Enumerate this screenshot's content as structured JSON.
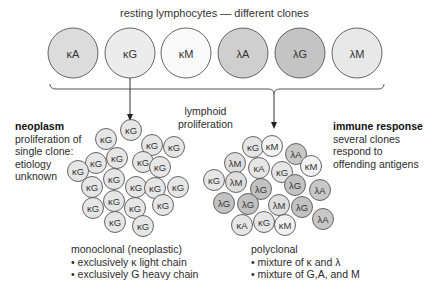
{
  "title": "resting lymphocytes — different clones",
  "resting_cells": [
    {
      "label": "κA",
      "fill": "#dcdcdc",
      "cx": 73,
      "cy": 53
    },
    {
      "label": "κG",
      "fill": "#ececec",
      "cx": 130,
      "cy": 53
    },
    {
      "label": "κM",
      "fill": "#fafafa",
      "cx": 186,
      "cy": 53
    },
    {
      "label": "λA",
      "fill": "#cfcfcf",
      "cx": 243,
      "cy": 53
    },
    {
      "label": "λG",
      "fill": "#c4c4c4",
      "cx": 300,
      "cy": 53
    },
    {
      "label": "λM",
      "fill": "#e8e8e8",
      "cx": 357,
      "cy": 53
    }
  ],
  "center_label": [
    "lymphoid",
    "proliferation"
  ],
  "left_panel": {
    "heading": "neoplasm",
    "lines": [
      "proliferation of",
      "single clone:",
      "etiology",
      "unknown"
    ],
    "caption_title": "monoclonal (neoplastic)",
    "bullets": [
      "exclusively κ light chain",
      "exclusively G heavy chain"
    ]
  },
  "right_panel": {
    "heading": "immune response",
    "lines": [
      "several clones",
      "respond to",
      "offending antigens"
    ],
    "caption_title": "polyclonal",
    "bullets": [
      "mixture of κ and λ",
      "mixture of G,A, and M"
    ]
  },
  "colors": {
    "outline": "#555555",
    "kappa_fill": "#e6e6e6",
    "lambda_fill": "#c8c8c8",
    "lambdaM_fill": "#dedede"
  },
  "monoclonal_cells": [
    {
      "label": "κG",
      "cx": 131,
      "cy": 130
    },
    {
      "label": "κG",
      "cx": 106,
      "cy": 139
    },
    {
      "label": "κG",
      "cx": 152,
      "cy": 145
    },
    {
      "label": "κG",
      "cx": 174,
      "cy": 147
    },
    {
      "label": "κG",
      "cx": 117,
      "cy": 158
    },
    {
      "label": "κG",
      "cx": 96,
      "cy": 163
    },
    {
      "label": "κG",
      "cx": 143,
      "cy": 162
    },
    {
      "label": "κG",
      "cx": 160,
      "cy": 167
    },
    {
      "label": "κG",
      "cx": 78,
      "cy": 171
    },
    {
      "label": "κG",
      "cx": 114,
      "cy": 179
    },
    {
      "label": "κG",
      "cx": 92,
      "cy": 187
    },
    {
      "label": "κG",
      "cx": 136,
      "cy": 187
    },
    {
      "label": "κG",
      "cx": 155,
      "cy": 188
    },
    {
      "label": "κG",
      "cx": 178,
      "cy": 187
    },
    {
      "label": "κG",
      "cx": 114,
      "cy": 201
    },
    {
      "label": "κG",
      "cx": 93,
      "cy": 208
    },
    {
      "label": "κG",
      "cx": 135,
      "cy": 208
    },
    {
      "label": "κG",
      "cx": 163,
      "cy": 205
    },
    {
      "label": "κG",
      "cx": 115,
      "cy": 222
    },
    {
      "label": "κG",
      "cx": 143,
      "cy": 226
    }
  ],
  "polyclonal_cells": [
    {
      "label": "κG",
      "cx": 253,
      "cy": 147,
      "fill": "#e6e6e6"
    },
    {
      "label": "κM",
      "cx": 272,
      "cy": 146,
      "fill": "#f2f2f2"
    },
    {
      "label": "λA",
      "cx": 296,
      "cy": 154,
      "fill": "#c8c8c8"
    },
    {
      "label": "λM",
      "cx": 235,
      "cy": 163,
      "fill": "#dedede"
    },
    {
      "label": "κA",
      "cx": 259,
      "cy": 168,
      "fill": "#e6e6e6"
    },
    {
      "label": "κG",
      "cx": 282,
      "cy": 172,
      "fill": "#e6e6e6"
    },
    {
      "label": "κM",
      "cx": 311,
      "cy": 166,
      "fill": "#f2f2f2"
    },
    {
      "label": "κG",
      "cx": 214,
      "cy": 180,
      "fill": "#e6e6e6"
    },
    {
      "label": "λM",
      "cx": 236,
      "cy": 182,
      "fill": "#dedede"
    },
    {
      "label": "λG",
      "cx": 261,
      "cy": 189,
      "fill": "#c2c2c2"
    },
    {
      "label": "λG",
      "cx": 295,
      "cy": 185,
      "fill": "#c2c2c2"
    },
    {
      "label": "λA",
      "cx": 320,
      "cy": 190,
      "fill": "#c8c8c8"
    },
    {
      "label": "λG",
      "cx": 224,
      "cy": 203,
      "fill": "#c2c2c2"
    },
    {
      "label": "λG",
      "cx": 248,
      "cy": 204,
      "fill": "#c2c2c2"
    },
    {
      "label": "λM",
      "cx": 279,
      "cy": 205,
      "fill": "#dedede"
    },
    {
      "label": "λG",
      "cx": 302,
      "cy": 207,
      "fill": "#c2c2c2"
    },
    {
      "label": "κA",
      "cx": 242,
      "cy": 225,
      "fill": "#e6e6e6"
    },
    {
      "label": "κG",
      "cx": 264,
      "cy": 222,
      "fill": "#e6e6e6"
    },
    {
      "label": "κM",
      "cx": 285,
      "cy": 225,
      "fill": "#f2f2f2"
    },
    {
      "label": "λA",
      "cx": 323,
      "cy": 219,
      "fill": "#c8c8c8"
    }
  ]
}
